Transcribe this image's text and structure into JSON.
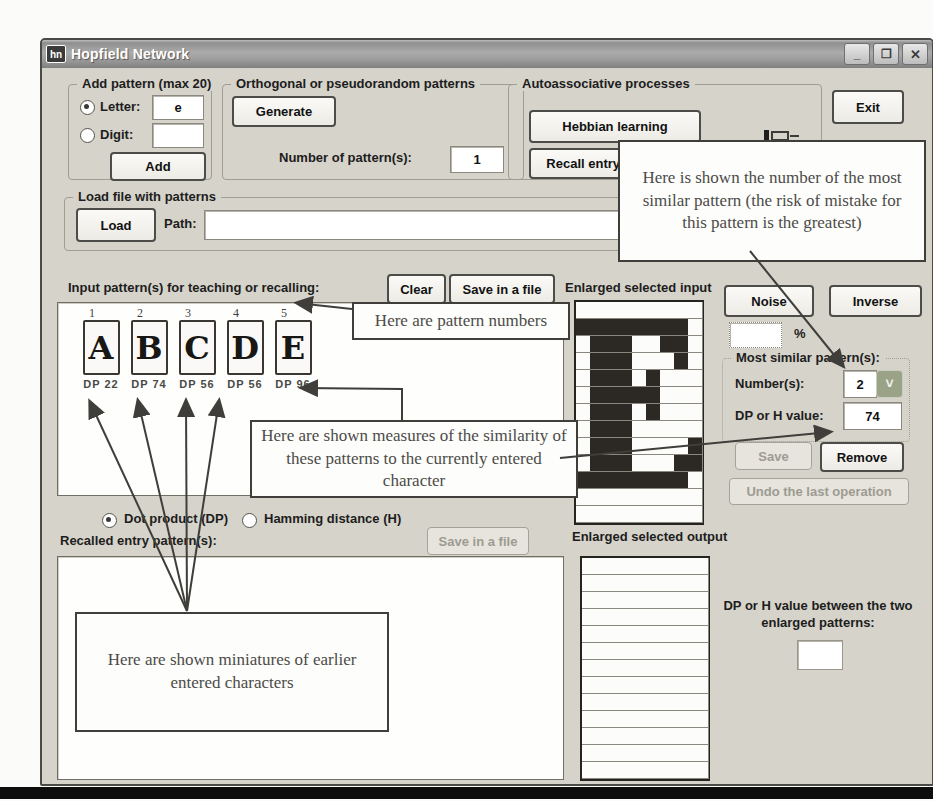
{
  "window": {
    "title": "Hopfield Network",
    "icon_text": "hn",
    "buttons": {
      "minimize": "_",
      "maximize": "❐",
      "close": "✕"
    }
  },
  "add_pattern": {
    "label": "Add pattern (max 20)",
    "letter_label": "Letter:",
    "letter_value": "e",
    "digit_label": "Digit:",
    "digit_value": "",
    "add": "Add"
  },
  "orthogonal": {
    "label": "Orthogonal or pseudorandom patterns",
    "generate": "Generate",
    "number_label": "Number of pattern(s):",
    "number_value": "1"
  },
  "auto": {
    "label": "Autoassociative processes",
    "hebbian": "Hebbian learning",
    "recall": "Recall entry pattern(s)"
  },
  "exit_label": "Exit",
  "load": {
    "label": "Load file with patterns",
    "button": "Load",
    "path_label": "Path:",
    "path_value": ""
  },
  "input_section": {
    "label": "Input pattern(s) for teaching or recalling:",
    "clear": "Clear",
    "save": "Save in a file",
    "enlarged_label": "Enlarged selected input",
    "patterns": [
      {
        "num": "1",
        "letter": "A",
        "dp": "DP 22"
      },
      {
        "num": "2",
        "letter": "B",
        "dp": "DP 74"
      },
      {
        "num": "3",
        "letter": "C",
        "dp": "DP 56"
      },
      {
        "num": "4",
        "letter": "D",
        "dp": "DP 56"
      },
      {
        "num": "5",
        "letter": "E",
        "dp": "DP 96"
      }
    ]
  },
  "right": {
    "noise": "Noise",
    "inverse": "Inverse",
    "percent_value": "",
    "percent_label": "%",
    "most": {
      "label": "Most similar pattern(s):",
      "num_label": "Number(s):",
      "num_value": "2",
      "dropdown_glyph": "˅",
      "dp_label": "DP or H value:",
      "dp_value": "74"
    },
    "save": "Save",
    "remove": "Remove",
    "undo": "Undo the last operation"
  },
  "metric": {
    "dot": "Dot product (DP)",
    "hamming": "Hamming distance (H)"
  },
  "recalled": {
    "label": "Recalled entry pattern(s):",
    "save": "Save in a file"
  },
  "output": {
    "label": "Enlarged selected output",
    "dp_between_label": "DP or H value between the two enlarged patterns:",
    "dp_between_value": ""
  },
  "annotations": {
    "number": "Here is shown the number of the most similar pattern (the risk of mistake for this pattern is the greatest)",
    "pattern_numbers": "Here are pattern numbers",
    "measures": "Here are shown measures of the similarity of these patterns to the currently entered character",
    "miniatures": "Here are shown miniatures of earlier entered characters"
  },
  "grids": {
    "cols": 9,
    "rows": 13,
    "input_bitmap": [
      ".........",
      "XXXXXXXX.",
      ".XXX..XX.",
      ".XXX...X.",
      ".XXX.X...",
      ".XXXXX...",
      ".XXX.X...",
      ".XXX.....",
      ".XXX....X",
      ".XXX...XX",
      "XXXXXXXX.",
      ".........",
      "........."
    ],
    "output_bitmap": []
  }
}
